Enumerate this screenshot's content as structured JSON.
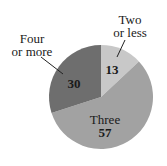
{
  "chart_data": {
    "type": "pie",
    "title": "",
    "start_angle_deg": 0,
    "direction": "clockwise",
    "slices": [
      {
        "label": "Two or less",
        "label_lines": [
          "Two",
          "or less"
        ],
        "value": 13,
        "color": "#c8c8c8"
      },
      {
        "label": "Three",
        "label_lines": [
          "Three"
        ],
        "value": 57,
        "color": "#a2a2a2"
      },
      {
        "label": "Four or more",
        "label_lines": [
          "Four",
          "or more"
        ],
        "value": 30,
        "color": "#6e6e6e"
      }
    ],
    "categories": [
      "Two or less",
      "Three",
      "Four or more"
    ],
    "values": [
      13,
      57,
      30
    ],
    "legend": "none (labels placed on/near slices)"
  }
}
